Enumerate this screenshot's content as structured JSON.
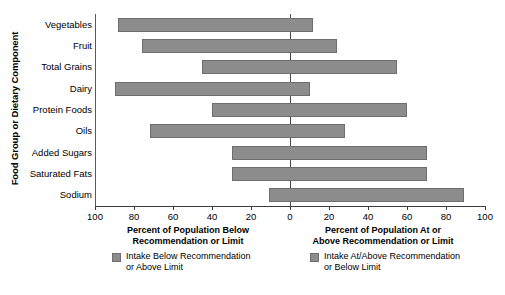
{
  "chart_data": {
    "type": "bar",
    "subtype": "diverging-horizontal-bar",
    "title": "",
    "xlabel_left": "Percent of Population Below Recommendation or Limit",
    "xlabel_right": "Percent of Population At or Above Recommendation or Limit",
    "ylabel": "Food Group or Dietary Component",
    "categories": [
      "Vegetables",
      "Fruit",
      "Total Grains",
      "Dairy",
      "Protein Foods",
      "Oils",
      "Added Sugars",
      "Saturated Fats",
      "Sodium"
    ],
    "series": [
      {
        "name": "Intake Below Recommendation or Above Limit",
        "axis": "left",
        "values": [
          88,
          76,
          45,
          90,
          40,
          72,
          30,
          30,
          11
        ]
      },
      {
        "name": "Intake At/Above Recommendation or Below Limit",
        "axis": "right",
        "values": [
          12,
          24,
          55,
          10,
          60,
          28,
          70,
          70,
          89
        ]
      }
    ],
    "xlim_left": [
      0,
      100
    ],
    "xlim_right": [
      0,
      100
    ],
    "xticks_left": [
      100,
      80,
      60,
      40,
      20,
      0
    ],
    "xticks_right": [
      0,
      20,
      40,
      60,
      80,
      100
    ],
    "xticks_all": [
      100,
      80,
      60,
      40,
      20,
      0,
      20,
      40,
      60,
      80,
      100
    ],
    "grid": false,
    "legend_position": "bottom",
    "bar_color": "#8c8c8c",
    "bar_border_color": "#6e6e6e",
    "zero_line_color": "#4a4a4a"
  },
  "legend": {
    "items": [
      {
        "label_line1": "Intake Below Recommendation",
        "label_line2": "or Above Limit"
      },
      {
        "label_line1": "Intake At/Above Recommendation",
        "label_line2": "or Below Limit"
      }
    ]
  },
  "axis_captions": {
    "left_line1": "Percent of Population Below",
    "left_line2": "Recommendation or Limit",
    "right_line1": "Percent of Population At or",
    "right_line2": "Above Recommendation or Limit"
  }
}
